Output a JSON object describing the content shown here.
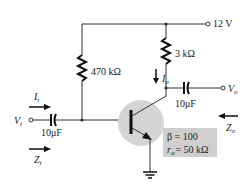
{
  "supply": {
    "label": "12 V"
  },
  "rb": {
    "label": "470 kΩ"
  },
  "rc": {
    "label": "3 kΩ"
  },
  "cin": {
    "label": "10μF"
  },
  "cout": {
    "label": "10μF"
  },
  "vin": {
    "sym": "V",
    "sub": "i"
  },
  "vout": {
    "sym": "V",
    "sub": "o"
  },
  "iin": {
    "sym": "I",
    "sub": "i"
  },
  "iout": {
    "sym": "I",
    "sub": "o"
  },
  "zin": {
    "sym": "Z",
    "sub": "i"
  },
  "zout": {
    "sym": "Z",
    "sub": "o"
  },
  "params": {
    "beta": "β = 100",
    "ro_sym": "r",
    "ro_sub": "o",
    "ro_val": "= 50 kΩ"
  },
  "colors": {
    "wire": "#333333",
    "transistor_bg": "#d4d4d4",
    "param_box": "#cfcfcf"
  }
}
